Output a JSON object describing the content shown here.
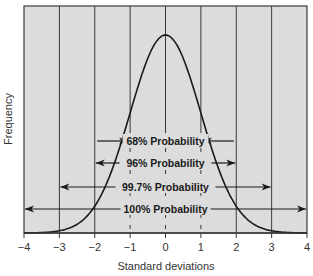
{
  "chart_data": {
    "type": "line",
    "title": "",
    "xlabel": "Standard deviations",
    "ylabel": "Frequency",
    "xlim": [
      -4,
      4
    ],
    "x_ticks": [
      -4,
      -3,
      -2,
      -1,
      0,
      1,
      2,
      3,
      4
    ],
    "x_tick_labels": [
      "−4",
      "−3",
      "−2",
      "−1",
      "0",
      "1",
      "2",
      "3",
      "4"
    ],
    "grid": {
      "vertical": true,
      "horizontal": false
    },
    "series": [
      {
        "name": "Normal distribution",
        "curve": "standard normal density",
        "mean": 0,
        "sd": 1
      }
    ],
    "annotations": [
      {
        "label": "68% Probability",
        "range": [
          -1,
          1
        ],
        "arrow_direction": "inward"
      },
      {
        "label": "96% Probability",
        "range": [
          -2,
          2
        ],
        "arrow_direction": "outward"
      },
      {
        "label": "99.7% Probability",
        "range": [
          -3,
          3
        ],
        "arrow_direction": "outward"
      },
      {
        "label": "100% Probability",
        "range": [
          -4,
          4
        ],
        "arrow_direction": "outward"
      }
    ],
    "colors": {
      "plot_background": "#dcdcdc",
      "grid": "#3a3a3a",
      "curve": "#1a1a1a",
      "arrows": "#1a1a1a",
      "text": "#333333"
    }
  }
}
